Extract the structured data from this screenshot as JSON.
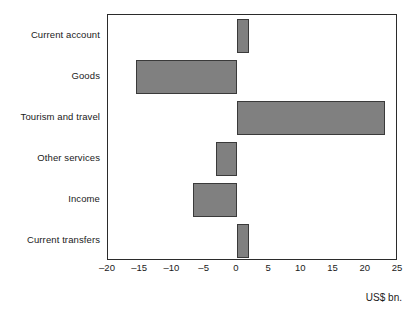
{
  "chart_data": {
    "type": "bar",
    "orientation": "horizontal",
    "title": "",
    "subtitle": "",
    "xlabel": "US$ bn.",
    "ylabel": "",
    "categories": [
      "Current account",
      "Goods",
      "Tourism and travel",
      "Other services",
      "Income",
      "Current transfers"
    ],
    "values": [
      1.9,
      -15.7,
      23.0,
      -3.2,
      -6.8,
      1.9
    ],
    "series": [
      {
        "name": "Balance",
        "values": [
          1.9,
          -15.7,
          23.0,
          -3.2,
          -6.8,
          1.9
        ]
      }
    ],
    "xlim": [
      -20,
      25
    ],
    "xticks": [
      -20,
      -15,
      -10,
      -5,
      0,
      5,
      10,
      15,
      20,
      25
    ],
    "xtick_labels": [
      "–20",
      "–15",
      "–10",
      "–5",
      "0",
      "5",
      "10",
      "15",
      "20",
      "25"
    ],
    "grid": false,
    "legend": false,
    "legend_position": "none",
    "bar_fill_color": "#808080",
    "bar_edge_color": "#3a3a3a",
    "frame_color": "#2b2b2b",
    "background_color": "#ffffff"
  }
}
